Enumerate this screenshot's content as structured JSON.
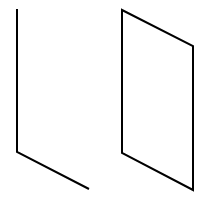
{
  "diagram": {
    "background": "#ffffff",
    "stroke_color": "#000000",
    "stroke_width": 2,
    "shapes": [
      {
        "name": "open-corner-shape",
        "kind": "polyline",
        "points": "17,9 17,152 89,189"
      },
      {
        "name": "parallelogram-shape",
        "kind": "polygon",
        "points": "122,10 193,46 193,190 122,153"
      }
    ]
  }
}
